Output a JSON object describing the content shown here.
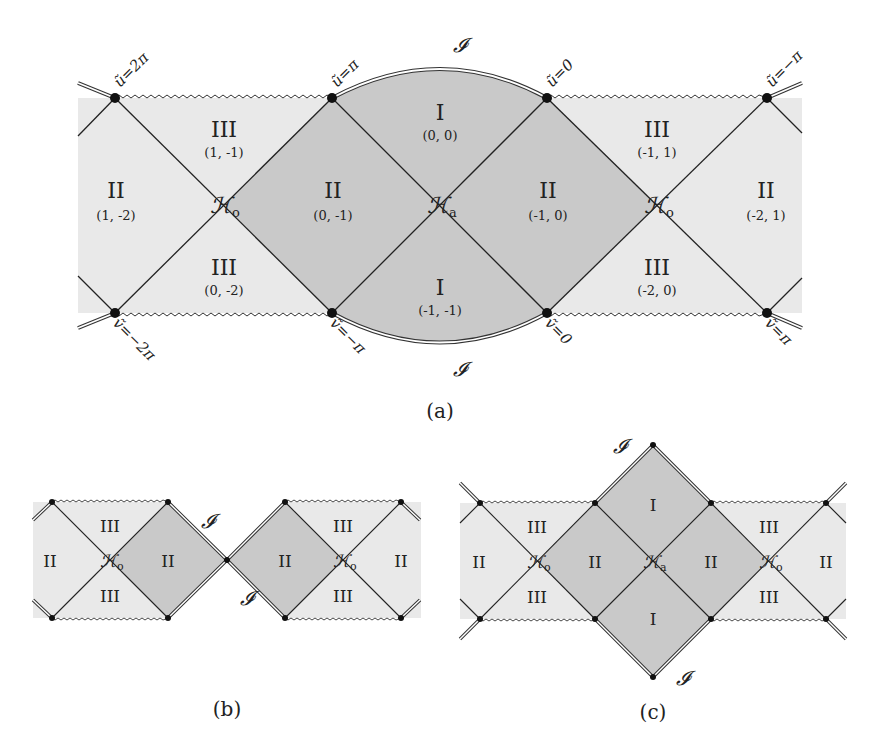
{
  "figure": {
    "panels": [
      {
        "id": "a",
        "caption": "(a)",
        "regions": [
          {
            "name": "II",
            "coord": "(1, -2)"
          },
          {
            "name": "III",
            "coord": "(1, -1)"
          },
          {
            "name": "III",
            "coord": "(0, -2)"
          },
          {
            "name": "II",
            "coord": "(0, -1)"
          },
          {
            "name": "I",
            "coord": "(0, 0)"
          },
          {
            "name": "I",
            "coord": "(-1, -1)"
          },
          {
            "name": "II",
            "coord": "(-1, 0)"
          },
          {
            "name": "III",
            "coord": "(-1, 1)"
          },
          {
            "name": "III",
            "coord": "(-2, 0)"
          },
          {
            "name": "II",
            "coord": "(-2, 1)"
          }
        ],
        "horizons": [
          "𝓗o",
          "𝓗a",
          "𝓗o"
        ],
        "horizon_labels": {
          "outer": "ℋ",
          "outer_sub": "o",
          "inner": "ℋ",
          "inner_sub": "a"
        },
        "scri_label": "𝓘",
        "top_boundary_labels": [
          "ũ=2π",
          "ũ=π",
          "ũ=0",
          "ũ=−π"
        ],
        "bottom_boundary_labels": [
          "ṽ=−2π",
          "ṽ=−π",
          "ṽ=0",
          "ṽ=π"
        ]
      },
      {
        "id": "b",
        "caption": "(b)",
        "regions": [
          "II",
          "III",
          "III",
          "II",
          "II",
          "III",
          "III",
          "II"
        ],
        "horizon_label": "ℋ",
        "horizon_sub": "o",
        "scri_label": "𝓘"
      },
      {
        "id": "c",
        "caption": "(c)",
        "regions": [
          "II",
          "III",
          "III",
          "II",
          "I",
          "I",
          "II",
          "III",
          "III",
          "II"
        ],
        "horizon_label": "ℋ",
        "horizon_sub_outer": "o",
        "horizon_sub_inner": "a",
        "scri_label": "𝓘"
      }
    ],
    "colors": {
      "outer_fill": "#e9e9e9",
      "inner_fill": "#c9c9c9",
      "line": "#222222",
      "background": "#ffffff"
    }
  }
}
